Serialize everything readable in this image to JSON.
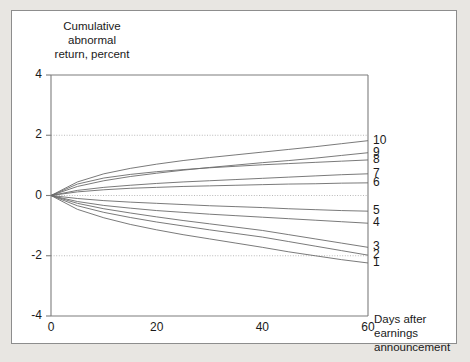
{
  "figure": {
    "y_axis_title": "Cumulative\nabnormal\nreturn, percent",
    "x_axis_title": "Days after\nearnings\nannouncement"
  },
  "chart_data": {
    "type": "line",
    "title": "",
    "subtitle": "",
    "xlabel": "Days after earnings announcement",
    "ylabel": "Cumulative abnormal return, percent",
    "xlim": [
      0,
      60
    ],
    "ylim": [
      -4,
      4
    ],
    "xticks": [
      0,
      20,
      40,
      60
    ],
    "yticks": [
      -4,
      -2,
      0,
      2,
      4
    ],
    "xtick_labels": [
      "0",
      "20",
      "40",
      "60"
    ],
    "ytick_labels": [
      "-4",
      "-2",
      "0",
      "2",
      "4"
    ],
    "grid": "horizontal dotted at y=2, y=0, y=-2",
    "gridlines": [
      2,
      0,
      -2
    ],
    "legend_position": "right-of-axis (series labels at x=60 endpoints)",
    "line_color": "#6b6b6b",
    "x": [
      0,
      5,
      10,
      15,
      20,
      25,
      30,
      35,
      40,
      45,
      50,
      55,
      60
    ],
    "series": [
      {
        "name": "10",
        "label": "10",
        "end_value": 1.82,
        "values": [
          0.0,
          0.45,
          0.72,
          0.9,
          1.04,
          1.16,
          1.26,
          1.35,
          1.44,
          1.53,
          1.62,
          1.72,
          1.82
        ]
      },
      {
        "name": "9",
        "label": "9",
        "end_value": 1.42,
        "values": [
          0.0,
          0.3,
          0.49,
          0.63,
          0.74,
          0.84,
          0.93,
          1.01,
          1.09,
          1.16,
          1.24,
          1.33,
          1.42
        ]
      },
      {
        "name": "8",
        "label": "8",
        "end_value": 1.18,
        "values": [
          0.0,
          0.38,
          0.58,
          0.7,
          0.79,
          0.86,
          0.92,
          0.97,
          1.02,
          1.06,
          1.1,
          1.14,
          1.18
        ]
      },
      {
        "name": "7",
        "label": "7",
        "end_value": 0.72,
        "values": [
          0.0,
          0.17,
          0.27,
          0.34,
          0.4,
          0.45,
          0.49,
          0.53,
          0.57,
          0.61,
          0.65,
          0.69,
          0.72
        ]
      },
      {
        "name": "6",
        "label": "6",
        "end_value": 0.42,
        "values": [
          0.0,
          0.12,
          0.19,
          0.24,
          0.27,
          0.3,
          0.32,
          0.34,
          0.36,
          0.38,
          0.39,
          0.41,
          0.42
        ]
      },
      {
        "name": "5",
        "label": "5",
        "end_value": -0.52,
        "values": [
          0.0,
          -0.1,
          -0.17,
          -0.22,
          -0.26,
          -0.3,
          -0.34,
          -0.37,
          -0.4,
          -0.44,
          -0.47,
          -0.5,
          -0.52
        ]
      },
      {
        "name": "4",
        "label": "4",
        "end_value": -0.92,
        "values": [
          0.0,
          -0.2,
          -0.33,
          -0.42,
          -0.5,
          -0.56,
          -0.62,
          -0.67,
          -0.72,
          -0.77,
          -0.82,
          -0.87,
          -0.92
        ]
      },
      {
        "name": "3",
        "label": "3",
        "end_value": -1.72,
        "values": [
          0.0,
          -0.26,
          -0.44,
          -0.58,
          -0.71,
          -0.83,
          -0.94,
          -1.05,
          -1.16,
          -1.3,
          -1.44,
          -1.58,
          -1.72
        ]
      },
      {
        "name": "2",
        "label": "2",
        "end_value": -1.98,
        "values": [
          0.0,
          -0.34,
          -0.56,
          -0.73,
          -0.88,
          -1.01,
          -1.14,
          -1.26,
          -1.38,
          -1.53,
          -1.68,
          -1.83,
          -1.98
        ]
      },
      {
        "name": "1",
        "label": "1",
        "end_value": -2.24,
        "values": [
          0.0,
          -0.46,
          -0.74,
          -0.96,
          -1.14,
          -1.3,
          -1.44,
          -1.58,
          -1.72,
          -1.87,
          -2.0,
          -2.13,
          -2.24
        ]
      }
    ]
  }
}
